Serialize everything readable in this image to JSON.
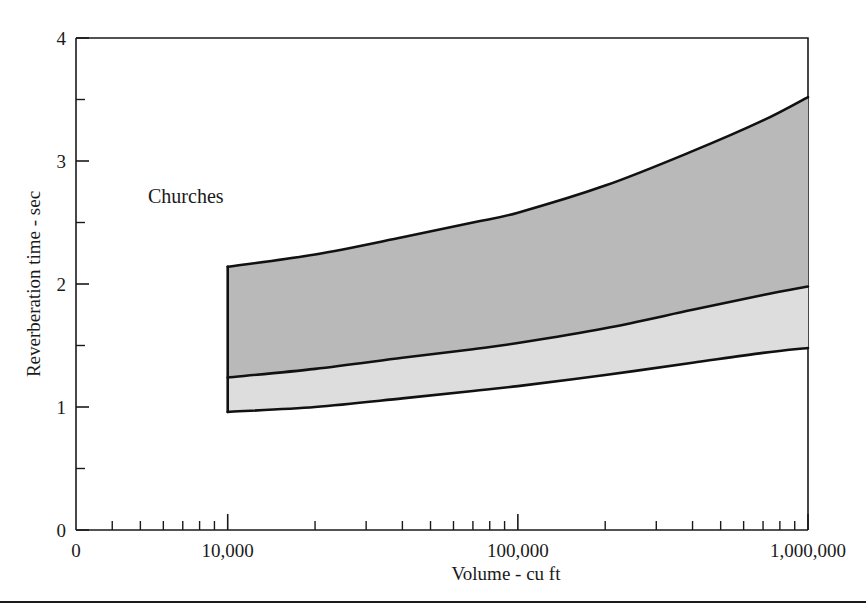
{
  "chart_data": {
    "type": "area",
    "title": "",
    "annotation": "Churches",
    "xlabel": "Volume - cu ft",
    "ylabel": "Reverberation time - sec",
    "xscale": "log",
    "yscale": "linear",
    "xlim": [
      3000,
      1000000
    ],
    "ylim": [
      0,
      4
    ],
    "grid": false,
    "legend": "none",
    "x_tick_labels": [
      "0",
      "10,000",
      "100,000",
      "1,000,000"
    ],
    "x_tick_values": [
      3000,
      10000,
      100000,
      1000000
    ],
    "y_tick_labels": [
      "0",
      "1",
      "2",
      "3",
      "4"
    ],
    "y_tick_values": [
      0,
      1,
      2,
      3,
      4
    ],
    "y_minor_ticks": [
      0.5,
      1.5,
      2.5,
      3.5
    ],
    "x_minor_ticks": [
      4000,
      5000,
      6000,
      7000,
      8000,
      9000,
      20000,
      30000,
      40000,
      50000,
      60000,
      70000,
      80000,
      90000,
      200000,
      300000,
      400000,
      500000,
      600000,
      700000,
      800000,
      900000
    ],
    "x": [
      10000,
      20000,
      40000,
      70000,
      100000,
      200000,
      400000,
      700000,
      1000000
    ],
    "series": [
      {
        "name": "upper-bound",
        "label": "Upper limit",
        "values": [
          2.14,
          2.24,
          2.38,
          2.5,
          2.58,
          2.8,
          3.08,
          3.33,
          3.52
        ]
      },
      {
        "name": "middle-bound",
        "label": "Middle limit",
        "values": [
          1.24,
          1.31,
          1.4,
          1.47,
          1.52,
          1.64,
          1.79,
          1.91,
          1.98
        ]
      },
      {
        "name": "lower-bound",
        "label": "Lower limit",
        "values": [
          0.96,
          1.0,
          1.07,
          1.13,
          1.17,
          1.26,
          1.36,
          1.44,
          1.48
        ]
      }
    ],
    "bands": [
      {
        "name": "upper-band",
        "label": "Upper range band",
        "color": "#b9b9b9",
        "from_series": "middle-bound",
        "to_series": "upper-bound"
      },
      {
        "name": "lower-band",
        "label": "Lower range band",
        "color": "#dddddd",
        "from_series": "lower-bound",
        "to_series": "middle-bound"
      }
    ],
    "colors": {
      "axis": "#1a1a1a",
      "curve": "#111111",
      "upper_band_fill": "#b9b9b9",
      "lower_band_fill": "#dddddd",
      "background": "#ffffff"
    }
  }
}
